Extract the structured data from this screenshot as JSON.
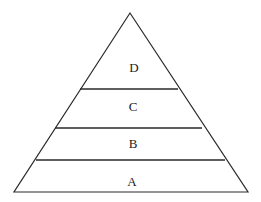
{
  "diagram": {
    "type": "pyramid",
    "levels_bottom_to_top": [
      {
        "label": "A"
      },
      {
        "label": "B"
      },
      {
        "label": "C"
      },
      {
        "label": "D"
      }
    ],
    "colors": {
      "stroke": "#2a2a2a",
      "text": "#222222",
      "background": "#ffffff"
    }
  }
}
